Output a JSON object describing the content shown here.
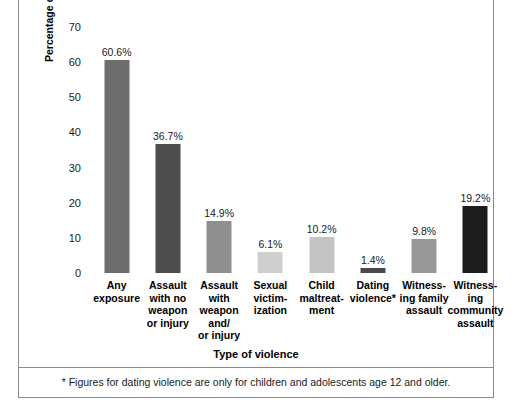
{
  "chart_data": {
    "type": "bar",
    "title": "",
    "xlabel": "Type of violence",
    "ylabel": "Percentage of children exposed",
    "ylim": [
      0,
      70
    ],
    "yticks": [
      0,
      10,
      20,
      30,
      40,
      50,
      60,
      70
    ],
    "grid": false,
    "legend": "none",
    "categories": [
      "Any exposure",
      "Assault with no weapon or injury",
      "Assault with weapon and/ or injury",
      "Sexual victim- ization",
      "Child maltreat- ment",
      "Dating violence*",
      "Witness- ing family assault",
      "Witness- ing community assault"
    ],
    "category_lines": [
      [
        "Any",
        "exposure"
      ],
      [
        "Assault",
        "with no",
        "weapon",
        "or injury"
      ],
      [
        "Assault",
        "with",
        "weapon",
        "and/",
        "or injury"
      ],
      [
        "Sexual",
        "victim-",
        "ization"
      ],
      [
        "Child",
        "maltreat-",
        "ment"
      ],
      [
        "Dating",
        "violence*"
      ],
      [
        "Witness-",
        "ing family",
        "assault"
      ],
      [
        "Witness-",
        "ing",
        "community",
        "assault"
      ]
    ],
    "values": [
      60.6,
      36.7,
      14.9,
      6.1,
      10.2,
      1.4,
      9.8,
      19.2
    ],
    "value_labels": [
      "60.6%",
      "36.7%",
      "14.9%",
      "6.1%",
      "10.2%",
      "1.4%",
      "9.8%",
      "19.2%"
    ],
    "bar_colors": [
      "#6e6e6e",
      "#4d4d4d",
      "#8f8f8f",
      "#cfcfcf",
      "#c4c4c4",
      "#4a4a4a",
      "#989898",
      "#1c1c1c"
    ]
  },
  "footnote": "* Figures for dating violence are only for children and adolescents age 12 and older.",
  "axis": {
    "y_title": "Percentage of children exposed",
    "x_title": "Type of violence"
  }
}
